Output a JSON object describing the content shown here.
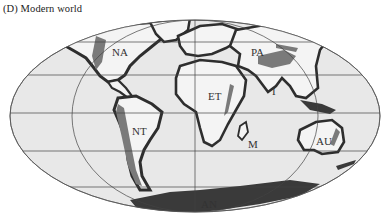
{
  "figure": {
    "title": "(D)  Modern world",
    "projection": "Mollweide"
  },
  "regions": [
    {
      "id": "NA",
      "label": "NA"
    },
    {
      "id": "PA",
      "label": "PA"
    },
    {
      "id": "ET",
      "label": "ET"
    },
    {
      "id": "I",
      "label": "I"
    },
    {
      "id": "NT",
      "label": "NT"
    },
    {
      "id": "M",
      "label": "M"
    },
    {
      "id": "AU",
      "label": "AU"
    },
    {
      "id": "AN",
      "label": "AN"
    }
  ],
  "colors": {
    "ocean": "#e9e9e9",
    "land": "#f3f3f3",
    "coast_dark": "#3a3a3a",
    "highland_gray": "#7d7d7d",
    "grid": "#444444"
  }
}
